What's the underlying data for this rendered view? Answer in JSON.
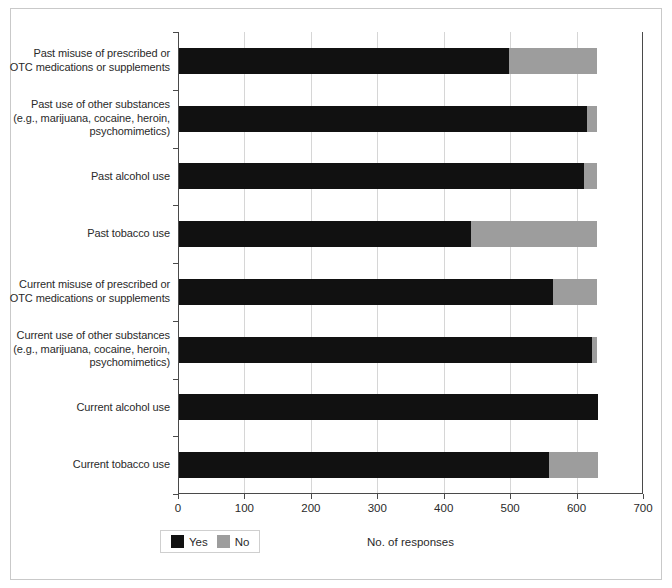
{
  "chart_data": {
    "type": "bar",
    "orientation": "horizontal",
    "stacked": true,
    "title": "",
    "xlabel": "No. of responses",
    "ylabel": "",
    "xlim": [
      0,
      700
    ],
    "xticks": [
      0,
      100,
      200,
      300,
      400,
      500,
      600,
      700
    ],
    "xtick_labels": [
      "0",
      "100",
      "200",
      "300",
      "400",
      "500",
      "600",
      "700"
    ],
    "grid": "vertical",
    "legend_position": "bottom-left",
    "categories": [
      "Past misuse of prescribed or OTC medications or supplements",
      "Past use of other substances (e.g., marijuana, cocaine, heroin, psychomimetics)",
      "Past alcohol use",
      "Past tobacco use",
      "Current misuse of prescribed or OTC medications or supplements",
      "Current use of other substances (e.g., marijuana, cocaine, heroin, psychomimetics)",
      "Current alcohol use",
      "Current tobacco use"
    ],
    "category_lines": [
      [
        "Past misuse of prescribed or",
        "OTC medications or supplements"
      ],
      [
        "Past use of other substances",
        "(e.g., marijuana, cocaine, heroin,",
        "psychomimetics)"
      ],
      [
        "Past alcohol use"
      ],
      [
        "Past tobacco use"
      ],
      [
        "Current misuse of prescribed or",
        "OTC medications or supplements"
      ],
      [
        "Current use of other substances",
        "(e.g., marijuana, cocaine, heroin,",
        "psychomimetics)"
      ],
      [
        "Current alcohol use"
      ],
      [
        "Current tobacco use"
      ]
    ],
    "series": [
      {
        "name": "Yes",
        "color": "#111111",
        "values": [
          497,
          614,
          610,
          440,
          563,
          622,
          631,
          557
        ]
      },
      {
        "name": "No",
        "color": "#9d9d9d",
        "values": [
          133,
          16,
          20,
          190,
          67,
          8,
          0,
          74
        ]
      }
    ]
  },
  "legend": {
    "items": [
      {
        "label": "Yes",
        "color": "#111111"
      },
      {
        "label": "No",
        "color": "#9d9d9d"
      }
    ]
  },
  "axis": {
    "x_title": "No. of responses"
  }
}
